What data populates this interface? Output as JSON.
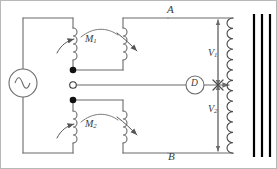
{
  "figure": {
    "type": "circuit-diagram",
    "title": "",
    "background_color": "#ffffff",
    "wire_color": "#6b6b6b",
    "core_color": "#000000",
    "label_color": "#3a3a3a"
  },
  "labels": {
    "node_top": "A",
    "node_bottom": "B",
    "mutual_top": "M",
    "mutual_top_sub": "1",
    "mutual_bottom": "M",
    "mutual_bottom_sub": "2",
    "voltage_top": "V",
    "voltage_top_sub": "1",
    "voltage_bottom": "V",
    "voltage_bottom_sub": "2",
    "detector": "D"
  },
  "components": {
    "ac_source": {
      "name": "ac-source",
      "symbol": "sine",
      "x": 22,
      "y": 82,
      "radius": 14
    },
    "detector": {
      "name": "detector",
      "symbol": "D",
      "x": 194,
      "y": 83,
      "radius": 9
    },
    "coil_m1_primary": {
      "name": "coil-m1-primary",
      "turns": 4,
      "variable": true
    },
    "coil_m1_secondary": {
      "name": "coil-m1-secondary",
      "turns": 4,
      "variable": true
    },
    "coil_m2_primary": {
      "name": "coil-m2-primary",
      "turns": 4,
      "variable": true
    },
    "coil_m2_secondary": {
      "name": "coil-m2-secondary",
      "turns": 4,
      "variable": true
    },
    "transformer_winding": {
      "name": "transformer-winding",
      "turns": 16,
      "tapped": true
    },
    "core": {
      "name": "transformer-core",
      "lines": 3
    }
  },
  "nodes": {
    "junction_top": {
      "name": "junction-top",
      "style": "filled",
      "x": 72,
      "y": 69
    },
    "centre_tap": {
      "name": "centre-tap",
      "style": "hollow",
      "x": 72,
      "y": 84
    },
    "junction_bottom": {
      "name": "junction-bottom",
      "style": "filled",
      "x": 72,
      "y": 99
    }
  },
  "dimensions": {
    "width": 277,
    "height": 169
  }
}
